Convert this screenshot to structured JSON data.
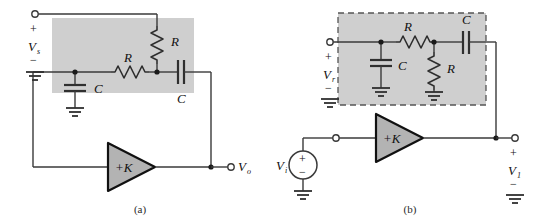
{
  "figure": {
    "type": "circuit-diagram",
    "background": "#ffffff",
    "wire_color": "#3a3a3a",
    "shade_fill": "#cfcfcf",
    "amp_fill": "#b3b3b3",
    "dash_color": "#555555"
  },
  "panels": [
    {
      "id": "a",
      "caption": "(a)",
      "input_port": {
        "plus": "+",
        "label": "V",
        "sublabel": "s",
        "minus": "−",
        "ground_icon": "ground-icon"
      },
      "output_port": {
        "label": "V",
        "sublabel": "o"
      },
      "amplifier": {
        "label": "+K",
        "icon": "amplifier-triangle-icon"
      },
      "components": [
        {
          "name": "resistor-series",
          "label": "R",
          "icon": "resistor-icon",
          "orientation": "horizontal"
        },
        {
          "name": "resistor-feedback",
          "label": "R",
          "icon": "resistor-icon",
          "orientation": "vertical"
        },
        {
          "name": "capacitor-shunt",
          "label": "C",
          "icon": "capacitor-icon",
          "orientation": "vertical"
        },
        {
          "name": "capacitor-feedback",
          "label": "C",
          "icon": "capacitor-icon",
          "orientation": "horizontal"
        }
      ],
      "shaded_box": {
        "style": "solid-fill",
        "border": "none"
      }
    },
    {
      "id": "b",
      "caption": "(b)",
      "input_port": {
        "plus": "+",
        "label": "V",
        "sublabel": "r",
        "minus": "−",
        "ground_icon": "ground-icon"
      },
      "source": {
        "label": "V",
        "sublabel": "i",
        "plus": "+",
        "minus": "−",
        "icon": "voltage-source-icon"
      },
      "output_port": {
        "plus": "+",
        "label": "V",
        "sublabel": "1",
        "minus": "−",
        "ground_icon": "ground-icon"
      },
      "amplifier": {
        "label": "+K",
        "icon": "amplifier-triangle-icon"
      },
      "components": [
        {
          "name": "capacitor-shunt",
          "label": "C",
          "icon": "capacitor-icon",
          "orientation": "vertical"
        },
        {
          "name": "resistor-series",
          "label": "R",
          "icon": "resistor-icon",
          "orientation": "horizontal"
        },
        {
          "name": "resistor-shunt",
          "label": "R",
          "icon": "resistor-icon",
          "orientation": "vertical"
        },
        {
          "name": "capacitor-series",
          "label": "C",
          "icon": "capacitor-icon",
          "orientation": "horizontal"
        }
      ],
      "shaded_box": {
        "style": "solid-fill",
        "border": "dashed"
      }
    }
  ]
}
